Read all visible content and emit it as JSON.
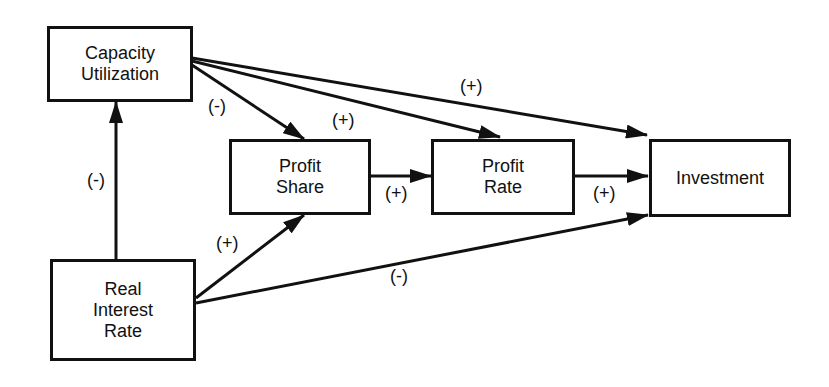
{
  "diagram": {
    "nodes": {
      "capacity_utilization": {
        "label": "Capacity\nUtilization"
      },
      "profit_share": {
        "label": "Profit\nShare"
      },
      "profit_rate": {
        "label": "Profit\nRate"
      },
      "investment": {
        "label": "Investment"
      },
      "real_interest_rate": {
        "label": "Real\nInterest\nRate"
      }
    },
    "edges": [
      {
        "from": "Real Interest Rate",
        "to": "Capacity Utilization",
        "sign": "(-)"
      },
      {
        "from": "Capacity Utilization",
        "to": "Profit Share",
        "sign": "(-)"
      },
      {
        "from": "Capacity Utilization",
        "to": "Profit Rate",
        "sign": "(+)"
      },
      {
        "from": "Capacity Utilization",
        "to": "Investment",
        "sign": "(+)"
      },
      {
        "from": "Profit Share",
        "to": "Profit Rate",
        "sign": "(+)"
      },
      {
        "from": "Profit Rate",
        "to": "Investment",
        "sign": "(+)"
      },
      {
        "from": "Real Interest Rate",
        "to": "Profit Share",
        "sign": "(+)"
      },
      {
        "from": "Real Interest Rate",
        "to": "Investment",
        "sign": "(-)"
      }
    ]
  }
}
